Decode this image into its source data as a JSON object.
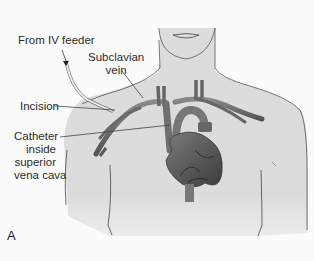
{
  "figure": {
    "panel_letter": "A",
    "labels": {
      "iv_feeder": "From IV feeder",
      "subclavian_line1": "Subclavian",
      "subclavian_line2": "vein",
      "incision": "Incision",
      "catheter_line1": "Catheter",
      "catheter_line2": "inside",
      "catheter_line3": "superior",
      "catheter_line4": "vena cava"
    },
    "colors": {
      "background": "#fbfbfb",
      "body_fill": "#dcdcdc",
      "body_outline": "#555555",
      "vessel": "#6a6a6a",
      "vessel_dark": "#4a4a4a",
      "heart": "#5a5a5a",
      "catheter_tube": "#e8e8e8",
      "leader_line": "#444444",
      "text": "#2b2b2b"
    }
  }
}
